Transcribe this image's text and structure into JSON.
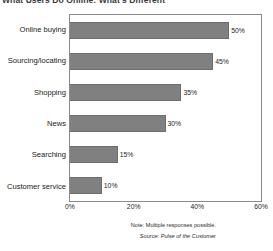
{
  "chart_data": {
    "type": "bar",
    "orientation": "horizontal",
    "title": "What Users Do Online: What's Different",
    "categories": [
      "Online buying",
      "Sourcing/locating",
      "Shopping",
      "News",
      "Searching",
      "Customer service"
    ],
    "values": [
      50,
      45,
      35,
      30,
      15,
      10
    ],
    "value_labels": [
      "50%",
      "45%",
      "35%",
      "30%",
      "15%",
      "10%"
    ],
    "xlabel": "",
    "ylabel": "",
    "xlim": [
      0,
      60
    ],
    "xticks": [
      0,
      20,
      40,
      60
    ],
    "xtick_labels": [
      "0%",
      "20%",
      "40%",
      "60%"
    ],
    "grid": false,
    "legend": false,
    "bar_color": "#808080",
    "bar_border_color": "#6e6e6e",
    "frame_color": "#8a8a8a"
  },
  "footer": {
    "note": "Note: Multiple responses possible.",
    "source": "Source: Pulse of the Customer"
  }
}
